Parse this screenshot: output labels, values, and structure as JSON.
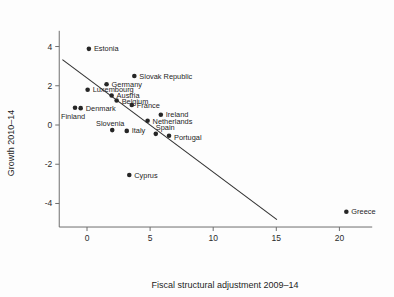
{
  "chart_data": {
    "type": "scatter",
    "title": "",
    "subtitle": "",
    "xlabel": "Fiscal structural adjustment 2009–14",
    "ylabel": "Growth 2010–14",
    "xlim": [
      -2.2,
      22.6
    ],
    "ylim": [
      -5.2,
      4.8
    ],
    "xticks": [
      0,
      5,
      10,
      15,
      20
    ],
    "xticklabels": [
      "0",
      "5",
      "10",
      "15",
      "20"
    ],
    "yticks": [
      4,
      2,
      0,
      -2,
      -4
    ],
    "yticklabels": [
      "4",
      "2",
      "0",
      "-2",
      "-4"
    ],
    "grid": false,
    "legend": "none",
    "marker_color": "#262626",
    "line_color": "#333333",
    "points": [
      {
        "label": "Estonia",
        "x": 0.15,
        "y": 3.88,
        "label_dx": 5,
        "label_dy": 2.6
      },
      {
        "label": "Slovak Republic",
        "x": 3.75,
        "y": 2.5,
        "label_dx": 5,
        "label_dy": 2.6
      },
      {
        "label": "Germany",
        "x": 1.55,
        "y": 2.08,
        "label_dx": 5,
        "label_dy": 2.6
      },
      {
        "label": "Luxembourg",
        "x": 0.05,
        "y": 1.8,
        "label_dx": 5,
        "label_dy": 2.6
      },
      {
        "label": "Austria",
        "x": 1.95,
        "y": 1.5,
        "label_dx": 5,
        "label_dy": 2.6
      },
      {
        "label": "Belgium",
        "x": 2.35,
        "y": 1.25,
        "label_dx": 5,
        "label_dy": 3.2
      },
      {
        "label": "France",
        "x": 3.55,
        "y": 1.02,
        "label_dx": 5,
        "label_dy": 2.6
      },
      {
        "label": "Finland",
        "x": -0.95,
        "y": 0.88,
        "label_dx": -2,
        "label_dy": 11.0
      },
      {
        "label": "Denmark",
        "x": -0.5,
        "y": 0.86,
        "label_dx": 5,
        "label_dy": 2.6
      },
      {
        "label": "Ireland",
        "x": 5.85,
        "y": 0.52,
        "label_dx": 5,
        "label_dy": 2.6
      },
      {
        "label": "Netherlands",
        "x": 4.8,
        "y": 0.22,
        "label_dx": 5,
        "label_dy": 3.2
      },
      {
        "label": "Slovenia",
        "x": 2.0,
        "y": -0.26,
        "label_dx": -2,
        "label_dy": -4.0
      },
      {
        "label": "Italy",
        "x": 3.15,
        "y": -0.3,
        "label_dx": 5,
        "label_dy": 2.6
      },
      {
        "label": "Spain",
        "x": 5.45,
        "y": -0.45,
        "label_dx": 0,
        "label_dy": -4.0
      },
      {
        "label": "Portugal",
        "x": 6.5,
        "y": -0.55,
        "label_dx": 5,
        "label_dy": 4.0
      },
      {
        "label": "Cyprus",
        "x": 3.35,
        "y": -2.55,
        "label_dx": 5,
        "label_dy": 2.6
      },
      {
        "label": "Greece",
        "x": 20.55,
        "y": -4.42,
        "label_dx": 5,
        "label_dy": 2.6
      }
    ],
    "fit_line": {
      "name": "linear fit",
      "x1": -1.95,
      "y1": 3.33,
      "x2": 15.05,
      "y2": -4.82
    }
  }
}
